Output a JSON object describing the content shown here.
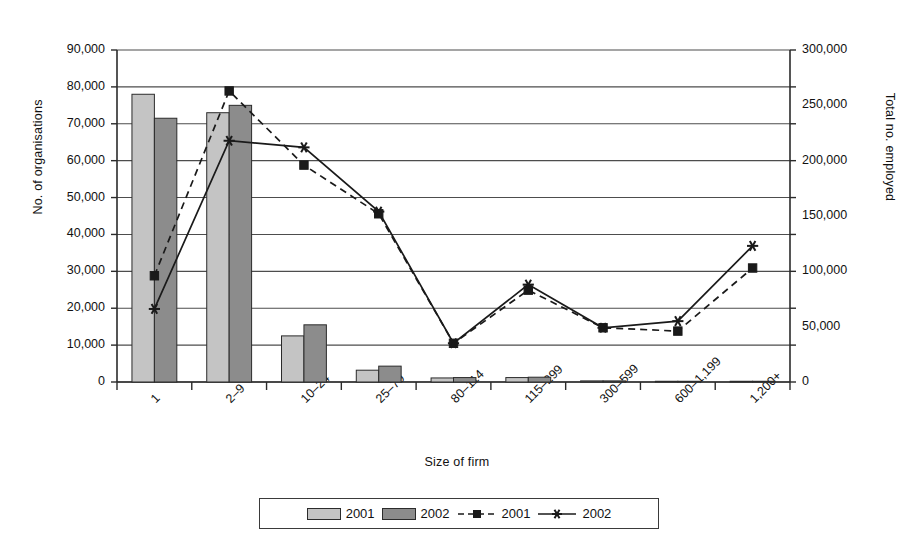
{
  "chart_data": {
    "type": "bar",
    "title": "",
    "xlabel": "Size of firm",
    "ylabel": "No. of organisations",
    "ylabel_secondary": "Total no. employed",
    "categories": [
      "1",
      "2–9",
      "10–24",
      "25–79",
      "80–114",
      "115–299",
      "300–599",
      "600–1,199",
      "1,200+"
    ],
    "ylim": [
      0,
      90000
    ],
    "ylim_secondary": [
      0,
      300000
    ],
    "yticks": [
      0,
      10000,
      20000,
      30000,
      40000,
      50000,
      60000,
      70000,
      80000,
      90000
    ],
    "ytick_labels": [
      "0",
      "10,000",
      "20,000",
      "30,000",
      "40,000",
      "50,000",
      "60,000",
      "70,000",
      "80,000",
      "90,000"
    ],
    "yticks_secondary": [
      0,
      50000,
      100000,
      150000,
      200000,
      250000,
      300000
    ],
    "ytick_labels_secondary": [
      "0",
      "50,000",
      "100,000",
      "150,000",
      "200,000",
      "250,000",
      "300,000"
    ],
    "grid": true,
    "legend_position": "bottom",
    "series": [
      {
        "name": "2001",
        "kind": "bar",
        "axis": "left",
        "color": "#c4c4c4",
        "values": [
          78000,
          73000,
          12500,
          3200,
          1100,
          1200,
          300,
          200,
          200
        ]
      },
      {
        "name": "2002",
        "kind": "bar",
        "axis": "left",
        "color": "#8c8c8c",
        "values": [
          71500,
          75000,
          15500,
          4300,
          1200,
          1300,
          300,
          200,
          200
        ]
      },
      {
        "name": "2001",
        "kind": "line",
        "axis": "right",
        "style": "dashed",
        "marker": "square",
        "color": "#1a1a1a",
        "values": [
          96000,
          263000,
          196000,
          152000,
          35000,
          83000,
          49000,
          46000,
          103000
        ]
      },
      {
        "name": "2002",
        "kind": "line",
        "axis": "right",
        "style": "solid",
        "marker": "asterisk",
        "color": "#1a1a1a",
        "values": [
          66000,
          218000,
          212000,
          154000,
          35000,
          88000,
          49000,
          55000,
          123000
        ]
      }
    ]
  },
  "legend": {
    "entries": [
      {
        "label": "2001",
        "type": "swatch-light"
      },
      {
        "label": "2002",
        "type": "swatch-dark"
      },
      {
        "label": "2001",
        "type": "line-dashed-square"
      },
      {
        "label": "2002",
        "type": "line-solid-asterisk"
      }
    ]
  },
  "colors": {
    "bar_2001": "#c4c4c4",
    "bar_2002": "#8c8c8c",
    "line": "#1a1a1a",
    "grid": "#4d4d4d",
    "axis": "#2b2b2b",
    "background": "#ffffff"
  }
}
